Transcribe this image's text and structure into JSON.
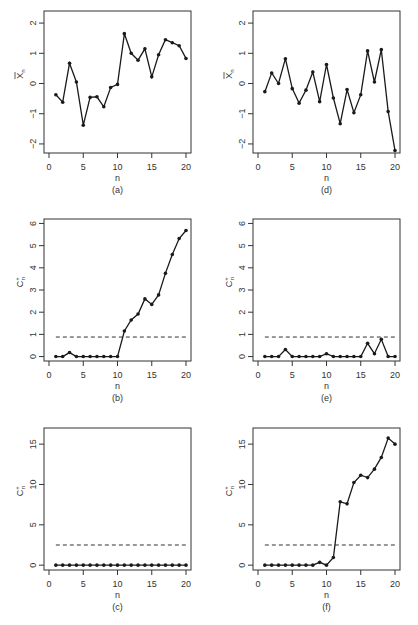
{
  "chart_data": [
    {
      "id": "a",
      "type": "line",
      "caption": "(a)",
      "xlabel": "n",
      "ylabel": "X̄n",
      "ylabel_main": "X",
      "ylabel_sub": "n",
      "ylabel_bar": true,
      "xlim": [
        0,
        20
      ],
      "ylim": [
        -2.3,
        2.4
      ],
      "xticks": [
        0,
        5,
        10,
        15,
        20
      ],
      "yticks": [
        -2,
        -1,
        0,
        1,
        2
      ],
      "x": [
        1,
        2,
        3,
        4,
        5,
        6,
        7,
        8,
        9,
        10,
        11,
        12,
        13,
        14,
        15,
        16,
        17,
        18,
        19,
        20
      ],
      "values": [
        -0.37,
        -0.62,
        0.67,
        0.05,
        -1.38,
        -0.46,
        -0.44,
        -0.77,
        -0.13,
        -0.03,
        1.65,
        1.0,
        0.77,
        1.15,
        0.22,
        0.95,
        1.45,
        1.35,
        1.25,
        0.83
      ],
      "threshold": null
    },
    {
      "id": "b",
      "type": "line",
      "caption": "(b)",
      "xlabel": "n",
      "ylabel": "C+n",
      "ylabel_main": "C",
      "ylabel_sup": "+",
      "ylabel_sub": "n",
      "xlim": [
        0,
        20
      ],
      "ylim": [
        -0.2,
        6.2
      ],
      "xticks": [
        0,
        5,
        10,
        15,
        20
      ],
      "yticks": [
        0,
        1,
        2,
        3,
        4,
        5,
        6
      ],
      "x": [
        1,
        2,
        3,
        4,
        5,
        6,
        7,
        8,
        9,
        10,
        11,
        12,
        13,
        14,
        15,
        16,
        17,
        18,
        19,
        20
      ],
      "values": [
        0,
        0,
        0.18,
        0,
        0,
        0,
        0,
        0,
        0,
        0,
        1.15,
        1.65,
        1.92,
        2.6,
        2.35,
        2.78,
        3.75,
        4.6,
        5.32,
        5.68
      ],
      "threshold": 0.88
    },
    {
      "id": "c",
      "type": "line",
      "caption": "(c)",
      "xlabel": "n",
      "ylabel": "C+n",
      "ylabel_main": "C",
      "ylabel_sup": "+",
      "ylabel_sub": "n",
      "xlim": [
        0,
        20
      ],
      "ylim": [
        -0.6,
        17
      ],
      "xticks": [
        0,
        5,
        10,
        15,
        20
      ],
      "yticks": [
        0,
        5,
        10,
        15
      ],
      "x": [
        1,
        2,
        3,
        4,
        5,
        6,
        7,
        8,
        9,
        10,
        11,
        12,
        13,
        14,
        15,
        16,
        17,
        18,
        19,
        20
      ],
      "values": [
        0,
        0,
        0,
        0,
        0,
        0,
        0,
        0,
        0,
        0,
        0,
        0,
        0,
        0,
        0,
        0,
        0,
        0,
        0,
        0
      ],
      "threshold": 2.5
    },
    {
      "id": "d",
      "type": "line",
      "caption": "(d)",
      "xlabel": "n",
      "ylabel": "X̄n",
      "ylabel_main": "X",
      "ylabel_sub": "n",
      "ylabel_bar": true,
      "xlim": [
        0,
        20
      ],
      "ylim": [
        -2.3,
        2.4
      ],
      "xticks": [
        0,
        5,
        10,
        15,
        20
      ],
      "yticks": [
        -2,
        -1,
        0,
        1,
        2
      ],
      "x": [
        1,
        2,
        3,
        4,
        5,
        6,
        7,
        8,
        9,
        10,
        11,
        12,
        13,
        14,
        15,
        16,
        17,
        18,
        19,
        20
      ],
      "values": [
        -0.27,
        0.35,
        0.0,
        0.82,
        -0.17,
        -0.65,
        -0.22,
        0.38,
        -0.6,
        0.63,
        -0.48,
        -1.33,
        -0.2,
        -0.97,
        -0.37,
        1.08,
        0.05,
        1.12,
        -0.93,
        -2.22
      ],
      "threshold": null
    },
    {
      "id": "e",
      "type": "line",
      "caption": "(e)",
      "xlabel": "n",
      "ylabel": "C+n",
      "ylabel_main": "C",
      "ylabel_sup": "+",
      "ylabel_sub": "n",
      "xlim": [
        0,
        20
      ],
      "ylim": [
        -0.2,
        6.2
      ],
      "xticks": [
        0,
        5,
        10,
        15,
        20
      ],
      "yticks": [
        0,
        1,
        2,
        3,
        4,
        5,
        6
      ],
      "x": [
        1,
        2,
        3,
        4,
        5,
        6,
        7,
        8,
        9,
        10,
        11,
        12,
        13,
        14,
        15,
        16,
        17,
        18,
        19,
        20
      ],
      "values": [
        0,
        0,
        0,
        0.32,
        0,
        0,
        0,
        0,
        0,
        0.13,
        0,
        0,
        0,
        0,
        0,
        0.6,
        0.13,
        0.78,
        0,
        0
      ],
      "threshold": 0.88
    },
    {
      "id": "f",
      "type": "line",
      "caption": "(f)",
      "xlabel": "n",
      "ylabel": "C+n",
      "ylabel_main": "C",
      "ylabel_sup": "+",
      "ylabel_sub": "n",
      "xlim": [
        0,
        20
      ],
      "ylim": [
        -0.6,
        17
      ],
      "xticks": [
        0,
        5,
        10,
        15,
        20
      ],
      "yticks": [
        0,
        5,
        10,
        15
      ],
      "x": [
        1,
        2,
        3,
        4,
        5,
        6,
        7,
        8,
        9,
        10,
        11,
        12,
        13,
        14,
        15,
        16,
        17,
        18,
        19,
        20
      ],
      "values": [
        0,
        0,
        0,
        0,
        0,
        0,
        0,
        0,
        0.35,
        0,
        0.95,
        7.85,
        7.6,
        10.25,
        11.15,
        10.85,
        11.9,
        13.35,
        15.75,
        15.0
      ],
      "threshold": 2.5
    }
  ],
  "layout": {
    "panels": [
      {
        "id": "a",
        "left": 0,
        "top": 0
      },
      {
        "id": "d",
        "left": 209,
        "top": 0
      },
      {
        "id": "b",
        "left": 0,
        "top": 208
      },
      {
        "id": "e",
        "left": 209,
        "top": 208
      },
      {
        "id": "c",
        "left": 0,
        "top": 417
      },
      {
        "id": "f",
        "left": 209,
        "top": 417
      }
    ]
  },
  "colors": {
    "line": "#1a1a1a",
    "axis": "#333333",
    "threshold": "#333333",
    "background": "#ffffff"
  }
}
